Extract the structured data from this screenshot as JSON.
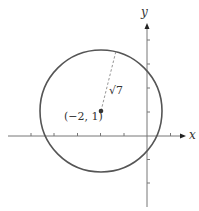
{
  "figure": {
    "axes": {
      "x_label": "x",
      "y_label": "y",
      "x_tick_count_left": 5,
      "x_tick_count_right": 1,
      "y_tick_count_up": 4,
      "y_tick_count_down": 3
    },
    "circle": {
      "center": [
        -2,
        1
      ],
      "radius_label": "√7",
      "radius_value": 2.6458
    },
    "center_label": "(−2, 1)",
    "colors": {
      "circle": "#555555",
      "axis": "#777777",
      "dashed": "#888888",
      "text": "#333333"
    }
  }
}
